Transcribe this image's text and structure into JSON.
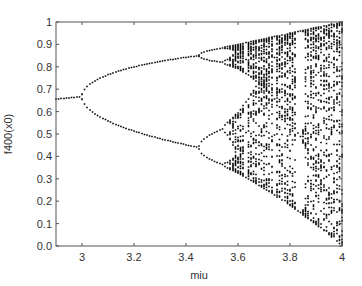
{
  "chart_data": {
    "type": "scatter",
    "title": "",
    "xlabel": "miu",
    "ylabel": "f400(x0)",
    "xlim": [
      2.9,
      4.0
    ],
    "ylim": [
      0.0,
      1.0
    ],
    "xticks": [
      3,
      3.2,
      3.4,
      3.6,
      3.8,
      4
    ],
    "xtick_labels": [
      "3",
      "3.2",
      "3.4",
      "3.6",
      "3.8",
      "4"
    ],
    "yticks": [
      0,
      0.1,
      0.2,
      0.3,
      0.4,
      0.5,
      0.6,
      0.7,
      0.8,
      0.9,
      1
    ],
    "ytick_labels": [
      "0.0",
      "0.1",
      "0.2",
      "0.3",
      "0.4",
      "0.5",
      "0.6",
      "0.7",
      "0.8",
      "0.9",
      "1"
    ],
    "grid": false,
    "legend": null,
    "marker_color": "#000000",
    "series": [
      {
        "name": "logistic map bifurcation",
        "description": "x(n+1) = miu * x(n) * (1 - x(n)); iterate 400 times, plot steady-state values",
        "miu_start": 2.9,
        "miu_end": 4.0,
        "miu_step": 0.01,
        "x0": 0.5,
        "transient_iterations": 400,
        "plotted_iterations": 60,
        "key_points": [
          {
            "miu": 2.9,
            "values": [
              0.655
            ]
          },
          {
            "miu": 3.0,
            "values": [
              0.667
            ]
          },
          {
            "miu": 3.2,
            "values": [
              0.513,
              0.799
            ]
          },
          {
            "miu": 3.4,
            "values": [
              0.452,
              0.842
            ]
          },
          {
            "miu": 3.45,
            "values": [
              0.44,
              0.85
            ]
          },
          {
            "miu": 3.5,
            "values": [
              0.383,
              0.501,
              0.827,
              0.875
            ]
          },
          {
            "miu": 3.83,
            "values": [
              0.156,
              0.504,
              0.957
            ]
          },
          {
            "miu": 4.0,
            "range": [
              0.0,
              1.0
            ]
          }
        ]
      }
    ]
  }
}
